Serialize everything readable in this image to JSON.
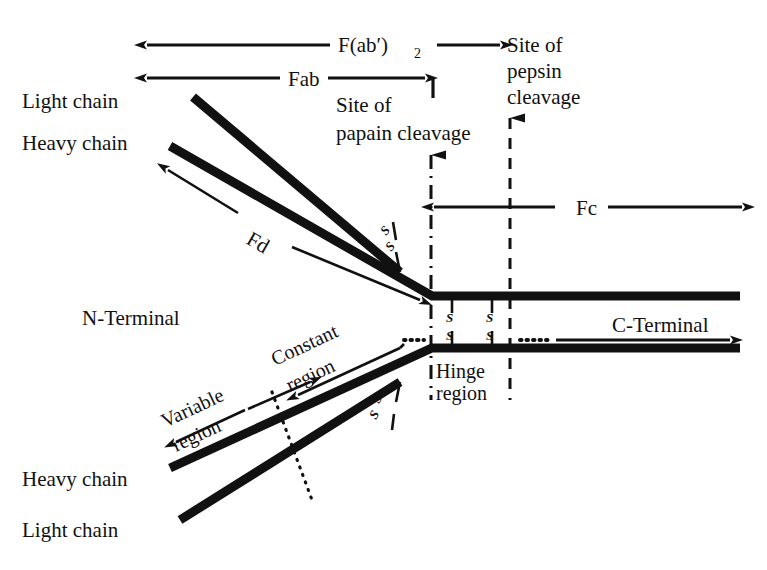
{
  "figure": {
    "ink_color": "#111111",
    "background": "#ffffff"
  },
  "labels": {
    "fab2": "F(ab′)",
    "fab2_sub": "2",
    "fab": "Fab",
    "fd": "Fd",
    "fc": "Fc",
    "site_papain_l1": "Site of",
    "site_papain_l2": "papain cleavage",
    "site_pepsin_l1": "Site of",
    "site_pepsin_l2": "pepsin",
    "site_pepsin_l3": "cleavage",
    "light_chain_top": "Light chain",
    "heavy_chain_top": "Heavy chain",
    "heavy_chain_bottom": "Heavy chain",
    "light_chain_bottom": "Light chain",
    "n_terminal": "N-Terminal",
    "c_terminal": "C-Terminal",
    "variable_l1": "Variable",
    "variable_l2": "region",
    "constant_l1": "Constant",
    "constant_l2": "region",
    "hinge_l1": "Hinge",
    "hinge_l2": "region",
    "disulfide": "S"
  },
  "disulfide_bonds": [
    {
      "name": "upper-arm-interchain",
      "label_top": "S",
      "label_bottom": "S"
    },
    {
      "name": "lower-arm-interchain",
      "label_top": "S",
      "label_bottom": "S"
    },
    {
      "name": "hinge-bond-1",
      "label_top": "S",
      "label_bottom": "S"
    },
    {
      "name": "hinge-bond-2",
      "label_top": "S",
      "label_bottom": "S"
    }
  ],
  "cleavage_sites": [
    {
      "name": "papain",
      "line_style": "dash-dot",
      "x": 430
    },
    {
      "name": "pepsin",
      "line_style": "dashed",
      "x": 510
    }
  ],
  "span_arrows": [
    {
      "name": "fab2",
      "label": "F(ab′)2",
      "x1": 145,
      "x2": 500,
      "y": 45,
      "heads": "both"
    },
    {
      "name": "fab",
      "label": "Fab",
      "x1": 145,
      "x2": 425,
      "y": 78,
      "heads": "both"
    },
    {
      "name": "fc",
      "label": "Fc",
      "x1": 432,
      "x2": 742,
      "y": 207,
      "heads": "both"
    },
    {
      "name": "fd",
      "label": "Fd",
      "heads": "both"
    },
    {
      "name": "variable-region",
      "label": "Variable region",
      "heads": "both"
    },
    {
      "name": "constant-region",
      "label": "Constant region",
      "heads": "left"
    },
    {
      "name": "c-terminal",
      "label": "C-Terminal",
      "heads": "right"
    }
  ]
}
